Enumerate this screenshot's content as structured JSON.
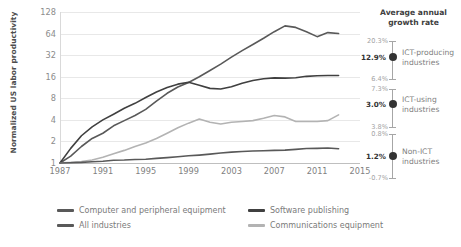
{
  "chart_data": {
    "type": "line",
    "title": "",
    "xlabel": "",
    "ylabel": "Normalized US labor productivity",
    "x_ticks": [
      "1987",
      "1991",
      "1995",
      "1999",
      "2003",
      "2007",
      "2011",
      "2015"
    ],
    "y_ticks": [
      "1",
      "2",
      "4",
      "8",
      "16",
      "32",
      "64",
      "128"
    ],
    "y_scale": "log2",
    "ylim": [
      1,
      128
    ],
    "xlim": [
      1987,
      2015
    ],
    "grid": true,
    "legend_position": "bottom",
    "x": [
      1987,
      1988,
      1989,
      1990,
      1991,
      1992,
      1993,
      1994,
      1995,
      1996,
      1997,
      1998,
      1999,
      2000,
      2001,
      2002,
      2003,
      2004,
      2005,
      2006,
      2007,
      2008,
      2009,
      2010,
      2011,
      2012,
      2013
    ],
    "series": [
      {
        "name": "Computer and peripheral equipment",
        "color": "#595959",
        "values": [
          1.0,
          1.25,
          1.7,
          2.2,
          2.6,
          3.3,
          3.9,
          4.6,
          5.6,
          7.3,
          9.4,
          11.5,
          13.3,
          16.0,
          19.5,
          24.0,
          30.0,
          37.0,
          45.0,
          55.0,
          68.0,
          82.0,
          78.0,
          68.0,
          58.0,
          66.0,
          64.0
        ]
      },
      {
        "name": "Software publishing",
        "color": "#404040",
        "values": [
          1.0,
          1.6,
          2.4,
          3.2,
          4.0,
          4.8,
          5.8,
          6.8,
          8.2,
          9.8,
          11.3,
          12.6,
          13.4,
          12.2,
          11.0,
          10.8,
          11.6,
          13.0,
          14.2,
          15.0,
          15.4,
          15.3,
          15.5,
          16.2,
          16.5,
          16.6,
          16.6
        ]
      },
      {
        "name": "Communications equipment",
        "color": "#b3b3b3",
        "values": [
          1.0,
          1.02,
          1.05,
          1.1,
          1.2,
          1.35,
          1.5,
          1.7,
          1.9,
          2.2,
          2.6,
          3.1,
          3.6,
          4.1,
          3.7,
          3.5,
          3.7,
          3.8,
          3.9,
          4.2,
          4.6,
          4.4,
          3.8,
          3.8,
          3.8,
          3.9,
          4.7
        ]
      },
      {
        "name": "All industries",
        "color": "#595959",
        "values": [
          1.0,
          1.01,
          1.02,
          1.04,
          1.06,
          1.09,
          1.1,
          1.12,
          1.13,
          1.16,
          1.19,
          1.22,
          1.26,
          1.29,
          1.33,
          1.38,
          1.42,
          1.45,
          1.47,
          1.48,
          1.5,
          1.51,
          1.55,
          1.59,
          1.6,
          1.62,
          1.58
        ]
      }
    ]
  },
  "annotation_panel": {
    "title": "Average annual\ngrowth rate",
    "title_line1": "Average annual",
    "title_line2": "growth rate",
    "groups": [
      {
        "label_line1": "ICT-producing",
        "label_line2": "industries",
        "label": "ICT-producing industries",
        "high": "20.3%",
        "mid": "12.9%",
        "low": "6.4%"
      },
      {
        "label_line1": "ICT-using",
        "label_line2": "industries",
        "label": "ICT-using industries",
        "high": "7.3%",
        "mid": "3.0%",
        "low": "3.8%"
      },
      {
        "label_line1": "Non-ICT",
        "label_line2": "industries",
        "label": "Non-ICT industries",
        "high": "0.8%",
        "mid": "1.2%",
        "low": "-0.7%"
      }
    ]
  },
  "legend": {
    "items": [
      {
        "label": "Computer and peripheral equipment",
        "color": "#595959"
      },
      {
        "label": "Software publishing",
        "color": "#404040"
      },
      {
        "label": "All industries",
        "color": "#595959"
      },
      {
        "label": "Communications equipment",
        "color": "#b3b3b3"
      }
    ]
  }
}
